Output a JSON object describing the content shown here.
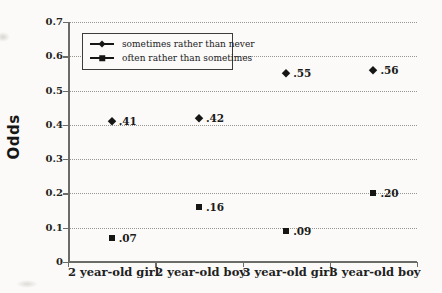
{
  "chart_data": {
    "type": "scatter",
    "title": "",
    "ylabel": "Odds",
    "xlabel": "",
    "ylim": [
      0,
      0.7
    ],
    "ytick_values": [
      0,
      0.1,
      0.2,
      0.3,
      0.4,
      0.5,
      0.6,
      0.7
    ],
    "ytick_labels": [
      "0",
      "0.1",
      "0.2",
      "0.3",
      "0.4",
      "0.5",
      "0.6",
      "0.7"
    ],
    "grid": "horizontal dotted gridlines at each 0.1",
    "legend_position": "inside top-left",
    "categories": [
      "2 year-old girl",
      "2 year-old boy",
      "3 year-old girl",
      "3 year-old boy"
    ],
    "series": [
      {
        "name": "sometimes rather than never",
        "marker": "diamond",
        "values": [
          0.41,
          0.42,
          0.55,
          0.56
        ],
        "point_labels": [
          ".41",
          ".42",
          ".55",
          ".56"
        ]
      },
      {
        "name": "often rather than sometimes",
        "marker": "square",
        "values": [
          0.07,
          0.16,
          0.09,
          0.2
        ],
        "point_labels": [
          ".07",
          ".16",
          ".09",
          ".20"
        ]
      }
    ]
  },
  "colors": {
    "background": "#fbfaf8",
    "axis": "#6b6b68",
    "grid_dots": "#979792",
    "marker": "#161614",
    "text": "#1c1c1c",
    "legend_border": "#3c3c39"
  }
}
